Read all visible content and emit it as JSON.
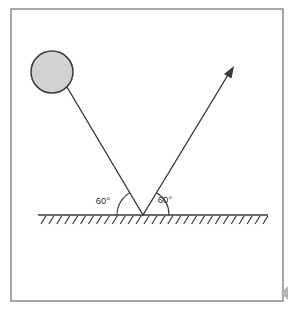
{
  "figure": {
    "kind": "physics-reflection-diagram",
    "background_color": "#ffffff",
    "frame": {
      "name": "outer-frame",
      "stroke_color": "#8a8a8a",
      "x": 11,
      "y": 9,
      "width": 272,
      "height": 292,
      "stroke_width": 1.5
    },
    "ball": {
      "name": "incident-ball",
      "fill_color": "#d2d2d2",
      "stroke_color": "#3a3a3a",
      "cx": 52,
      "cy": 72,
      "r": 21
    },
    "incident_ray": {
      "name": "incident-ray",
      "stroke_color": "#3a3a3a",
      "x1": 67,
      "y1": 87,
      "x2": 143,
      "y2": 215
    },
    "reflected_ray": {
      "name": "reflected-ray",
      "stroke_color": "#3a3a3a",
      "x1": 143,
      "y1": 215,
      "x2": 231,
      "y2": 70,
      "arrow_tip_x": 234,
      "arrow_tip_y": 66
    },
    "ground": {
      "name": "ground-surface",
      "stroke_color": "#3a3a3a",
      "y": 215,
      "x_start": 38,
      "x_end": 268,
      "hatch_count": 29,
      "hatch_depth": 9,
      "hatch_lean": 5
    },
    "vertex": {
      "name": "reflection-point",
      "x": 143,
      "y": 215
    },
    "angles": [
      {
        "name": "incident-angle",
        "label": "60°",
        "label_x": 103,
        "label_y": 204,
        "arc_radius": 26,
        "side": "left"
      },
      {
        "name": "reflected-angle",
        "label": "60°",
        "label_x": 165,
        "label_y": 203,
        "arc_radius": 26,
        "side": "right"
      }
    ],
    "edge_marker": {
      "name": "edge-triangle-marker",
      "fill_color": "#b4b4b4",
      "x": 288,
      "y": 293,
      "size": 7
    }
  }
}
